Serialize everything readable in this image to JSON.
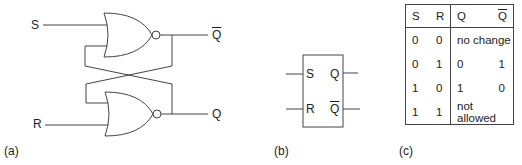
{
  "panel_a": {
    "caption": "(a)",
    "inputs": {
      "s": "S",
      "r": "R"
    },
    "outputs": {
      "q_bar": "Q",
      "q": "Q"
    },
    "gates": [
      "NOR (top)",
      "NOR (bottom)"
    ]
  },
  "panel_b": {
    "caption": "(b)",
    "pins": {
      "s": "S",
      "r": "R",
      "q": "Q",
      "q_bar": "Q"
    }
  },
  "panel_c": {
    "caption": "(c)",
    "headers": [
      "S",
      "R",
      "Q",
      "Q"
    ],
    "rows": [
      {
        "s": "0",
        "r": "0",
        "result": "no change"
      },
      {
        "s": "0",
        "r": "1",
        "q": "0",
        "q_bar": "1"
      },
      {
        "s": "1",
        "r": "0",
        "q": "1",
        "q_bar": "0"
      },
      {
        "s": "1",
        "r": "1",
        "result": "not allowed"
      }
    ]
  },
  "colors": {
    "line": "#444444",
    "text": "#222222"
  }
}
